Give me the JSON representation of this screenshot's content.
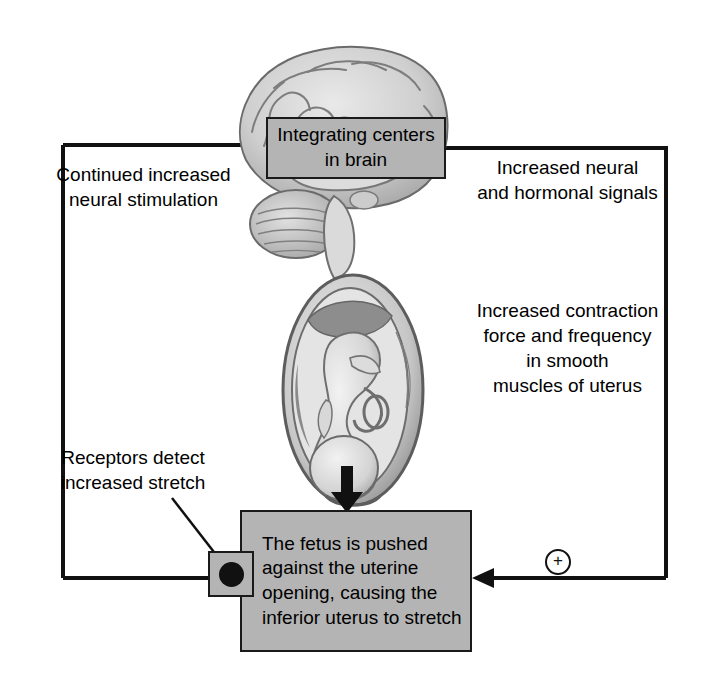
{
  "diagram": {
    "type": "positive-feedback-cycle",
    "colors": {
      "box_fill": "#b4b4b4",
      "box_border": "#1a1a1a",
      "line": "#111111",
      "text": "#000000",
      "background": "#ffffff"
    }
  },
  "boxes": {
    "brain": {
      "label": "Integrating\ncenters in brain",
      "line1": "Integrating",
      "line2": "centers in brain"
    },
    "fetus": {
      "label": "The fetus is\npushed against\nthe uterine opening,\ncausing the inferior\nuterus to stretch",
      "line1": "The fetus is",
      "line2": "pushed against",
      "line3": "the uterine opening,",
      "line4": "causing the inferior",
      "line5": "uterus to stretch"
    }
  },
  "labels": {
    "continued_stimulation": "Continued increased\nneural stimulation",
    "increased_signals": "Increased neural\nand hormonal signals",
    "increased_contraction": "Increased contraction\nforce and frequency\nin smooth\nmuscles of uterus",
    "receptors": "Receptors detect\nincreased stretch"
  },
  "symbols": {
    "positive_feedback": "+",
    "positive_feedback_name": "circled-plus"
  },
  "illustrations": [
    {
      "name": "brain-illustration",
      "description": "sagittal section of human brain with cerebrum and cerebellum"
    },
    {
      "name": "fetus-in-uterus-illustration",
      "description": "fetus positioned head-down inside the uterus"
    },
    {
      "name": "downward-pressure-arrow",
      "description": "thick black arrow pointing down at the cervix"
    }
  ],
  "flow": {
    "arrow_into_brain": "arrow pointing right into integrating centers in brain",
    "arrow_into_fetus_box": "arrow pointing left into the fetus box"
  }
}
